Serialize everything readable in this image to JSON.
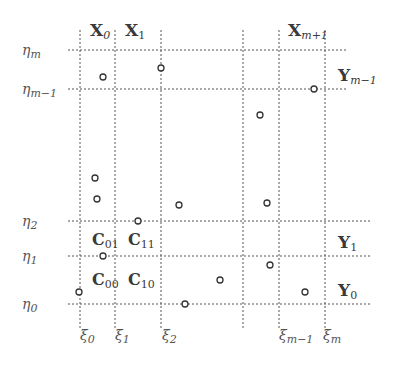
{
  "diagram": {
    "vertical_lines": [
      {
        "x": 80,
        "label_main": "ξ",
        "label_sub": "0"
      },
      {
        "x": 115,
        "label_main": "ξ",
        "label_sub": "1"
      },
      {
        "x": 161,
        "label_main": "ξ",
        "label_sub": "2"
      },
      {
        "x": 243,
        "label_main": "",
        "label_sub": ""
      },
      {
        "x": 279,
        "label_main": "ξ",
        "label_sub": "m−1"
      },
      {
        "x": 325,
        "label_main": "ξ",
        "label_sub": "m"
      }
    ],
    "horizontal_lines": [
      {
        "y": 50,
        "label_main": "η",
        "label_sub": "m"
      },
      {
        "y": 89,
        "label_main": "η",
        "label_sub": "m−1"
      },
      {
        "y": 221,
        "label_main": "η",
        "label_sub": "2"
      },
      {
        "y": 256,
        "label_main": "η",
        "label_sub": "1"
      },
      {
        "y": 304,
        "label_main": "η",
        "label_sub": "0"
      }
    ],
    "column_labels": [
      {
        "main": "X",
        "sub": "0"
      },
      {
        "main": "X",
        "sub": "1"
      },
      {
        "main": "X",
        "sub": "m+1"
      }
    ],
    "row_labels": [
      {
        "main": "Y",
        "sub": "m−1"
      },
      {
        "main": "Y",
        "sub": "1"
      },
      {
        "main": "Y",
        "sub": "0"
      }
    ],
    "cell_labels": [
      {
        "main": "C",
        "sub": "01"
      },
      {
        "main": "C",
        "sub": "11"
      },
      {
        "main": "C",
        "sub": "00"
      },
      {
        "main": "C",
        "sub": "10"
      }
    ],
    "points": [
      [
        103,
        77
      ],
      [
        161,
        68
      ],
      [
        314,
        89
      ],
      [
        260,
        115
      ],
      [
        95,
        178
      ],
      [
        97,
        199
      ],
      [
        179,
        205
      ],
      [
        267,
        203
      ],
      [
        138,
        221
      ],
      [
        103,
        256
      ],
      [
        270,
        265
      ],
      [
        220,
        280
      ],
      [
        79,
        292
      ],
      [
        305,
        292
      ],
      [
        185,
        304
      ]
    ]
  }
}
